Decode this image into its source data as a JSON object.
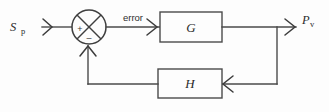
{
  "diagram": {
    "type": "control-system-block-diagram",
    "background_color": "#fdfdfd",
    "line_color": "#4a4a4a",
    "text_color": "#2b2b2b",
    "signals": {
      "input": {
        "base": "S",
        "subscript": "p",
        "full": "Sp",
        "meaning": "setpoint"
      },
      "error": {
        "label": "error"
      },
      "output": {
        "base": "P",
        "subscript": "v",
        "full": "Pv",
        "meaning": "process value"
      }
    },
    "summing_junction": {
      "name": "summing-junction",
      "shape": "circle-with-cross",
      "positive_sign": "+",
      "negative_sign": "–",
      "positive_input": "Sp",
      "negative_input": "feedback from H"
    },
    "blocks": [
      {
        "id": "forward",
        "label": "G",
        "role": "forward-path-transfer-function"
      },
      {
        "id": "feedback",
        "label": "H",
        "role": "feedback-path-transfer-function"
      }
    ]
  }
}
